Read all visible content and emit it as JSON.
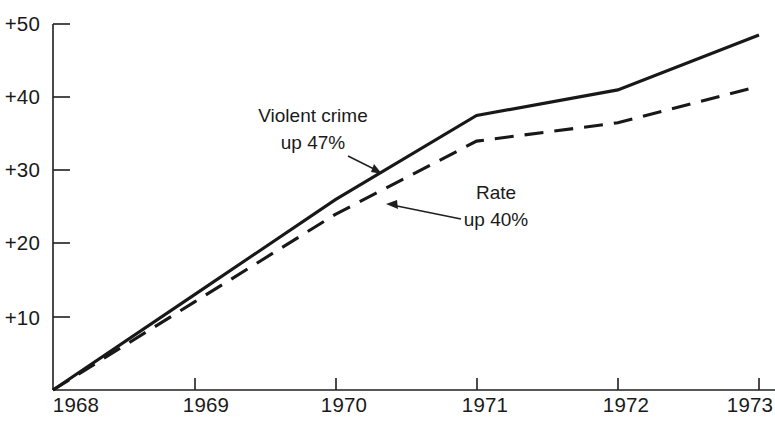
{
  "chart_data": {
    "type": "line",
    "title": "",
    "subtitle": "",
    "xlabel": "",
    "ylabel": "",
    "x": [
      1968,
      1969,
      1970,
      1971,
      1972,
      1973
    ],
    "xtick_labels": [
      "1968",
      "1969",
      "1970",
      "1971",
      "1972",
      "1973"
    ],
    "ytick_labels": [
      "+50",
      "+40",
      "+30",
      "+20",
      "+10"
    ],
    "ytick_values": [
      50,
      40,
      30,
      20,
      10
    ],
    "xlim": [
      1968,
      1973
    ],
    "ylim": [
      0,
      50
    ],
    "grid": false,
    "legend": "none",
    "series": [
      {
        "name": "Violent crime",
        "style": "solid",
        "color": "#181818",
        "values": [
          0,
          13,
          26,
          37.5,
          41,
          48.5
        ]
      },
      {
        "name": "Rate",
        "style": "dashed",
        "color": "#181818",
        "values": [
          0,
          12,
          24,
          34,
          36.5,
          41.5
        ]
      }
    ],
    "annotations": [
      {
        "id": "violent-crime-annotation",
        "line1": "Violent crime",
        "line2": "up 47%",
        "text_x": 313,
        "text_y1": 122,
        "text_y2": 149,
        "arrow_from_x": 348,
        "arrow_from_y": 156,
        "arrow_to_x": 381,
        "arrow_to_y": 173,
        "target_series": "Violent crime"
      },
      {
        "id": "rate-annotation",
        "line1": "Rate",
        "line2": "up 40%",
        "text_x": 496,
        "text_y1": 199,
        "text_y2": 226,
        "arrow_from_x": 461,
        "arrow_from_y": 219,
        "arrow_to_x": 387,
        "arrow_to_y": 204,
        "target_series": "Rate"
      }
    ]
  },
  "axes": {
    "y_axis_name": "percent-change-axis",
    "x_axis_name": "year-axis",
    "origin_value": 0
  }
}
